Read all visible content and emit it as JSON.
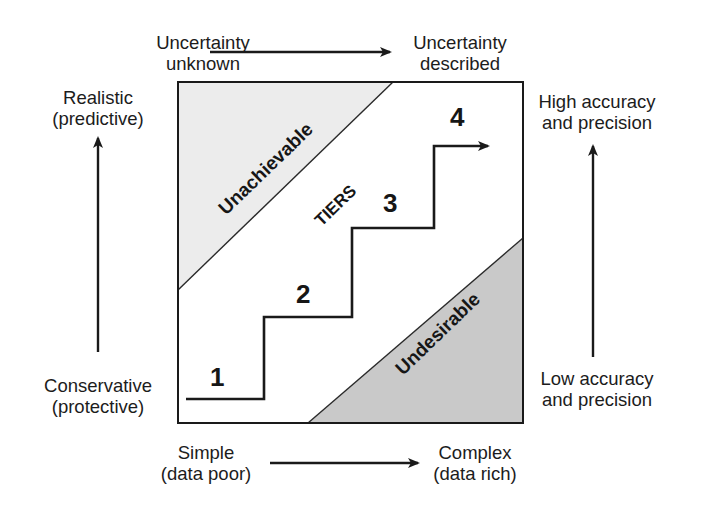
{
  "diagram": {
    "top_axis": {
      "start_label": [
        "Uncertainty",
        "unknown"
      ],
      "end_label": [
        "Uncertainty",
        "described"
      ]
    },
    "bottom_axis": {
      "start_label": [
        "Simple",
        "(data poor)"
      ],
      "end_label": [
        "Complex",
        "(data rich)"
      ]
    },
    "left_axis": {
      "top_label": [
        "Realistic",
        "(predictive)"
      ],
      "bottom_label": [
        "Conservative",
        "(protective)"
      ]
    },
    "right_axis": {
      "top_label": [
        "High accuracy",
        "and precision"
      ],
      "bottom_label": [
        "Low accuracy",
        "and precision"
      ]
    },
    "regions": {
      "upper": "Unachievable",
      "middle": "TIERS",
      "lower": "Undesirable"
    },
    "tiers": [
      "1",
      "2",
      "3",
      "4"
    ],
    "colors": {
      "line": "#1a1a1a",
      "unachievable_fill": "#ececec",
      "undesirable_fill": "#c9c9c9",
      "background": "#ffffff"
    }
  }
}
